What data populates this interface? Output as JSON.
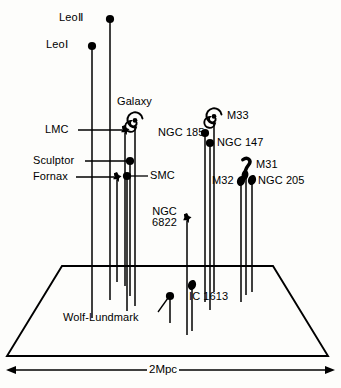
{
  "figure": {
    "title_visible": false,
    "scale_bar": {
      "label": "2Mpc",
      "arrow_left": "◀",
      "arrow_right": "▶"
    },
    "colors": {
      "ink": "#000000",
      "paper": "#fdfdfb"
    }
  },
  "chart_data": {
    "type": "scatter",
    "title": "",
    "subtitle": "",
    "xlabel": "",
    "ylabel": "",
    "annotations": [
      "2Mpc"
    ],
    "layout": {
      "projection": "3d-stem-plot-on-trapezoid-plane",
      "grid": false,
      "legend": false,
      "plane_top_edge": [
        [
          62,
          266
        ],
        [
          273,
          266
        ]
      ],
      "plane_bottom_edge": [
        [
          7,
          356
        ],
        [
          328,
          356
        ]
      ],
      "scale_bar_y": 370
    },
    "points": [
      {
        "name": "LeoII",
        "label": "LeoⅡ",
        "marker": "dot",
        "x": 110,
        "y": 19,
        "stem_bottom": 300,
        "label_x": 59,
        "label_y": 12,
        "leader": false
      },
      {
        "name": "LeoI",
        "label": "LeoⅠ",
        "marker": "dot",
        "x": 92,
        "y": 46,
        "stem_bottom": 318,
        "label_x": 46,
        "label_y": 39,
        "leader": false
      },
      {
        "name": "Galaxy",
        "label": "Galaxy",
        "marker": "spiral",
        "x": 135,
        "y": 120,
        "stem_bottom": 306,
        "label_x": 117,
        "label_y": 96,
        "leader": false
      },
      {
        "name": "LMC",
        "label": "LMC",
        "marker": "star",
        "x": 125,
        "y": 130,
        "stem_bottom": 286,
        "label_x": 45,
        "label_y": 124,
        "leader": true,
        "leader_from": [
          78,
          130
        ],
        "leader_to": [
          122,
          130
        ]
      },
      {
        "name": "Sculptor",
        "label": "Sculptor",
        "marker": "dot",
        "x": 130,
        "y": 161,
        "stem_bottom": 296,
        "label_x": 33,
        "label_y": 155,
        "leader": true,
        "leader_from": [
          85,
          161
        ],
        "leader_to": [
          127,
          161
        ]
      },
      {
        "name": "Fornax",
        "label": "Fornax",
        "marker": "star",
        "x": 117,
        "y": 177,
        "stem_bottom": 282,
        "label_x": 33,
        "label_y": 171,
        "leader": true,
        "leader_from": [
          76,
          177
        ],
        "leader_to": [
          114,
          177
        ]
      },
      {
        "name": "SMC",
        "label": "SMC",
        "marker": "dot",
        "x": 127,
        "y": 176,
        "stem_bottom": 311,
        "label_x": 150,
        "label_y": 170,
        "leader": true,
        "leader_from": [
          130,
          176
        ],
        "leader_to": [
          148,
          176
        ]
      },
      {
        "name": "NGC185",
        "label": "NGC 185",
        "marker": "dot",
        "x": 205,
        "y": 133,
        "stem_bottom": 302,
        "label_x": 158,
        "label_y": 127,
        "leader": false
      },
      {
        "name": "NGC147",
        "label": "NGC 147",
        "marker": "dot",
        "x": 210,
        "y": 143,
        "stem_bottom": 310,
        "label_x": 217,
        "label_y": 137,
        "leader": false
      },
      {
        "name": "M33",
        "label": "M33",
        "marker": "spiral",
        "x": 214,
        "y": 116,
        "stem_bottom": 292,
        "label_x": 227,
        "label_y": 110,
        "leader": false
      },
      {
        "name": "M31",
        "label": "M31",
        "marker": "m31",
        "x": 246,
        "y": 166,
        "stem_bottom": 295,
        "label_x": 256,
        "label_y": 159,
        "leader": false
      },
      {
        "name": "M32",
        "label": "M32",
        "marker": "blob",
        "x": 241,
        "y": 181,
        "stem_bottom": 302,
        "label_x": 212,
        "label_y": 175,
        "leader": false
      },
      {
        "name": "NGC205",
        "label": "NGC 205",
        "marker": "blob",
        "x": 252,
        "y": 180,
        "stem_bottom": 292,
        "label_x": 258,
        "label_y": 175,
        "leader": false
      },
      {
        "name": "NGC6822",
        "label": "NGC\n6822",
        "marker": "star",
        "x": 187,
        "y": 218,
        "stem_bottom": 335,
        "label_x": 152,
        "label_y": 206,
        "leader": false
      },
      {
        "name": "IC1613",
        "label": "IC 1613",
        "marker": "blob",
        "x": 192,
        "y": 285,
        "stem_bottom": 331,
        "label_x": 189,
        "label_y": 291,
        "leader": false
      },
      {
        "name": "WolfLundmark",
        "label": "Wolf-Lundmark",
        "marker": "dot",
        "x": 170,
        "y": 296,
        "stem_bottom": 323,
        "label_x": 63,
        "label_y": 312,
        "leader": true,
        "leader_from": [
          158,
          312
        ],
        "leader_to": [
          168,
          298
        ]
      }
    ],
    "stems": [
      {
        "name": "LeoII-stem",
        "x": 110,
        "y_top": 19,
        "y_bottom": 300
      },
      {
        "name": "LeoI-stem",
        "x": 92,
        "y_top": 46,
        "y_bottom": 318
      },
      {
        "name": "Galaxy-stem",
        "x": 135,
        "y_top": 126,
        "y_bottom": 306
      },
      {
        "name": "LMC-stem",
        "x": 125,
        "y_top": 133,
        "y_bottom": 286
      },
      {
        "name": "Sculptor-stem",
        "x": 130,
        "y_top": 164,
        "y_bottom": 296
      },
      {
        "name": "Fornax-stem",
        "x": 117,
        "y_top": 180,
        "y_bottom": 282
      },
      {
        "name": "SMC-stem",
        "x": 127,
        "y_top": 179,
        "y_bottom": 311
      },
      {
        "name": "NGC185-stem",
        "x": 205,
        "y_top": 136,
        "y_bottom": 302
      },
      {
        "name": "NGC147-stem",
        "x": 210,
        "y_top": 146,
        "y_bottom": 310
      },
      {
        "name": "M33-stem",
        "x": 214,
        "y_top": 122,
        "y_bottom": 292
      },
      {
        "name": "M31-stem",
        "x": 246,
        "y_top": 172,
        "y_bottom": 295
      },
      {
        "name": "M32-stem",
        "x": 241,
        "y_top": 184,
        "y_bottom": 302
      },
      {
        "name": "NGC205-stem",
        "x": 252,
        "y_top": 184,
        "y_bottom": 292
      },
      {
        "name": "NGC6822-stem",
        "x": 187,
        "y_top": 221,
        "y_bottom": 335
      },
      {
        "name": "IC1613-stem",
        "x": 192,
        "y_top": 288,
        "y_bottom": 331
      },
      {
        "name": "WLM-stem",
        "x": 170,
        "y_top": 299,
        "y_bottom": 323
      }
    ]
  }
}
